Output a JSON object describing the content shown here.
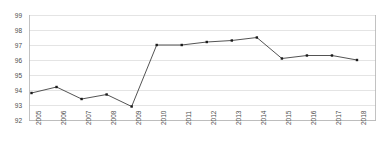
{
  "chart_data": {
    "type": "line",
    "title": "",
    "subtitle": "",
    "xlabel": "",
    "ylabel": "",
    "categories": [
      "2005",
      "2006",
      "2007",
      "2008",
      "2009",
      "2010",
      "2011",
      "2012",
      "2013",
      "2014",
      "2015",
      "2016",
      "2017",
      "2018"
    ],
    "values": [
      93.8,
      94.2,
      93.4,
      93.7,
      92.9,
      97.0,
      97.0,
      97.2,
      97.3,
      97.5,
      96.1,
      96.3,
      96.3,
      96.0
    ],
    "series": [
      {
        "name": "series-1",
        "values": [
          93.8,
          94.2,
          93.4,
          93.7,
          92.9,
          97.0,
          97.0,
          97.2,
          97.3,
          97.5,
          96.1,
          96.3,
          96.3,
          96.0
        ]
      }
    ],
    "ylim": [
      92,
      99
    ],
    "yticks": [
      92,
      93,
      94,
      95,
      96,
      97,
      98,
      99
    ],
    "ytick_labels": [
      "92",
      "93",
      "94",
      "95",
      "96",
      "97",
      "98",
      "99"
    ],
    "xtick_labels": [
      "2005",
      "2006",
      "2007",
      "2008",
      "2009",
      "2010",
      "2011",
      "2012",
      "2013",
      "2014",
      "2015",
      "2016",
      "2017",
      "2018"
    ],
    "grid": true,
    "grid_axis": "y",
    "legend": false,
    "legend_position": "none",
    "marker": "square",
    "line_color": "#3f3f3f",
    "marker_color": "#1a1a1a",
    "grid_color": "#d9d9d9",
    "axis_color": "#b3b3b3",
    "tick_label_color": "#4d4d4d",
    "background_color": "#ffffff",
    "annotations": []
  }
}
